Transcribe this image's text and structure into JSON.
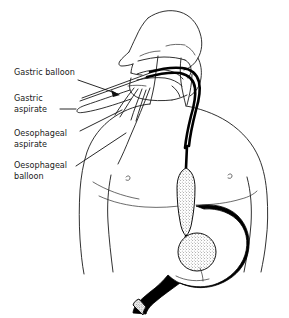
{
  "figure": {
    "type": "medical-line-diagram",
    "background_color": "#ffffff",
    "ink_color": "#1a1a1a",
    "organ_fill_color": "#000000",
    "width": 289,
    "height": 318
  },
  "labels": [
    {
      "id": "gastric-balloon",
      "text": "Gastric balloon",
      "lines": [
        "Gastric balloon"
      ],
      "x": 14,
      "y": 75,
      "leader": "arrow"
    },
    {
      "id": "gastric-aspirate",
      "text": "Gastric aspirate",
      "lines": [
        "Gastric",
        "aspirate"
      ],
      "x": 14,
      "y": 101,
      "leader": "line"
    },
    {
      "id": "oesophageal-aspirate",
      "text": "Oesophageal aspirate",
      "lines": [
        "Oesophageal",
        "aspirate"
      ],
      "x": 14,
      "y": 136,
      "leader": "line"
    },
    {
      "id": "oesophageal-balloon",
      "text": "Oesophageal balloon",
      "lines": [
        "Oesophageal",
        "balloon"
      ],
      "x": 14,
      "y": 168,
      "leader": "line"
    }
  ],
  "label_text": {
    "gastric_balloon_l1": "Gastric balloon",
    "gastric_aspirate_l1": "Gastric",
    "gastric_aspirate_l2": "aspirate",
    "oesophageal_aspirate_l1": "Oesophageal",
    "oesophageal_aspirate_l2": "aspirate",
    "oesophageal_balloon_l1": "Oesophageal",
    "oesophageal_balloon_l2": "balloon"
  },
  "anatomy": [
    {
      "id": "head-profile",
      "name": "Head in sagittal profile"
    },
    {
      "id": "nose",
      "name": "Nose"
    },
    {
      "id": "hard-palate",
      "name": "Hard palate"
    },
    {
      "id": "tongue",
      "name": "Tongue"
    },
    {
      "id": "soft-palate",
      "name": "Soft palate"
    },
    {
      "id": "pharynx",
      "name": "Pharynx"
    },
    {
      "id": "neck",
      "name": "Neck"
    },
    {
      "id": "torso",
      "name": "Upper torso"
    },
    {
      "id": "left-arm",
      "name": "Left arm"
    },
    {
      "id": "right-arm",
      "name": "Right arm"
    },
    {
      "id": "chest-nipple",
      "name": "Nipple"
    },
    {
      "id": "stomach",
      "name": "Stomach (filled black)"
    },
    {
      "id": "duodenum",
      "name": "Duodenum"
    },
    {
      "id": "oesophagus",
      "name": "Oesophagus"
    }
  ],
  "device": [
    {
      "id": "tube-shaft",
      "name": "Balloon tamponade tube shaft"
    },
    {
      "id": "tube-ports",
      "name": "External tube lumens / ports"
    },
    {
      "id": "oesophageal-balloon-body",
      "name": "Oesophageal balloon (elongated, inflated)"
    },
    {
      "id": "gastric-balloon-body",
      "name": "Gastric balloon (round, inflated)"
    }
  ]
}
